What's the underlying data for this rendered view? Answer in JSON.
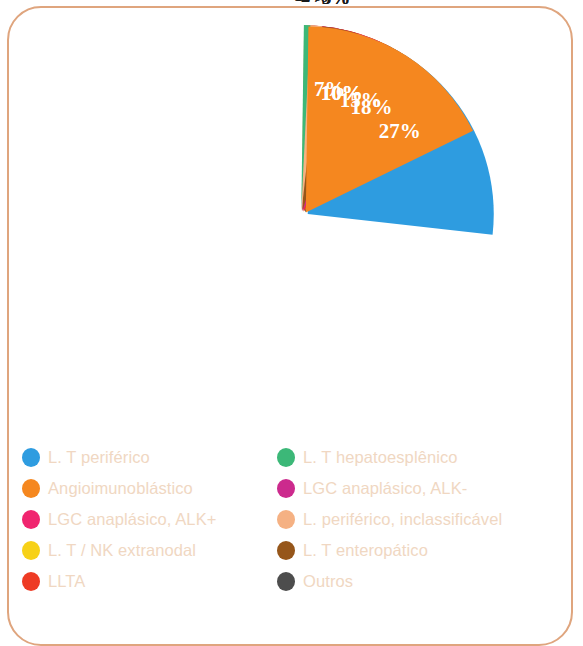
{
  "figure": {
    "frame_color": "#dfa57e",
    "background": "#ffffff",
    "legend_text_color": "#f0d7c2"
  },
  "chart_data": {
    "type": "pie",
    "title": "",
    "subtitle": "",
    "xlabel": "",
    "ylabel": "",
    "units": "percent",
    "total": 100,
    "exploded": true,
    "legend_position": "bottom",
    "grid": false,
    "start_angle_deg": -90,
    "direction": "clockwise",
    "categories": [
      "Outros",
      "L. T / NK extranodal",
      "LLTA",
      "LGC anaplásico, ALK-",
      "LGC anaplásico, ALK+",
      "L. T enteropático",
      "L. periférico, inclassificável",
      "L. T hepatoesplênico",
      "L. T periférico",
      "Angioimunoblástico"
    ],
    "values": [
      15,
      10,
      10,
      7,
      5,
      5,
      2,
      1,
      27,
      18
    ],
    "labels": [
      "15%",
      "10%",
      "10%",
      "7%",
      "5%",
      "5%",
      "2%",
      "1%",
      "27%",
      "18%"
    ],
    "colors": [
      "#4d4d4d",
      "#f7d117",
      "#ee3b24",
      "#cc2a8d",
      "#f0256f",
      "#96561a",
      "#f5b183",
      "#3cb878",
      "#2e9ce0",
      "#f5871f"
    ],
    "slices": [
      {
        "name": "Outros",
        "value": 15,
        "label": "15%",
        "color": "#4d4d4d",
        "label_placement": "inside"
      },
      {
        "name": "L. T / NK extranodal",
        "value": 10,
        "label": "10%",
        "color": "#f7d117",
        "label_placement": "inside"
      },
      {
        "name": "LLTA",
        "value": 10,
        "label": "10%",
        "color": "#ee3b24",
        "label_placement": "inside"
      },
      {
        "name": "LGC anaplásico, ALK-",
        "value": 7,
        "label": "7%",
        "color": "#cc2a8d",
        "label_placement": "inside"
      },
      {
        "name": "LGC anaplásico, ALK+",
        "value": 5,
        "label": "5%",
        "color": "#f0256f",
        "label_placement": "outside"
      },
      {
        "name": "L. T enteropático",
        "value": 5,
        "label": "5%",
        "color": "#96561a",
        "label_placement": "outside"
      },
      {
        "name": "L. periférico, inclassificável",
        "value": 2,
        "label": "2%",
        "color": "#f5b183",
        "label_placement": "outside"
      },
      {
        "name": "L. T hepatoesplênico",
        "value": 1,
        "label": "1%",
        "color": "#3cb878",
        "label_placement": "outside"
      },
      {
        "name": "L. T periférico",
        "value": 27,
        "label": "27%",
        "color": "#2e9ce0",
        "label_placement": "inside"
      },
      {
        "name": "Angioimunoblástico",
        "value": 18,
        "label": "18%",
        "color": "#f5871f",
        "label_placement": "inside"
      }
    ]
  },
  "legend": {
    "column_left": [
      {
        "label": "L. T periférico",
        "color": "#2e9ce0"
      },
      {
        "label": "Angioimunoblástico",
        "color": "#f5871f"
      },
      {
        "label": "LGC anaplásico, ALK+",
        "color": "#f0256f"
      },
      {
        "label": "L. T / NK extranodal",
        "color": "#f7d117"
      },
      {
        "label": "LLTA",
        "color": "#ee3b24"
      }
    ],
    "column_right": [
      {
        "label": "L. T hepatoesplênico",
        "color": "#3cb878"
      },
      {
        "label": "LGC anaplásico, ALK-",
        "color": "#cc2a8d"
      },
      {
        "label": "L. periférico, inclassificável",
        "color": "#f5b183"
      },
      {
        "label": "L. T enteropático",
        "color": "#96561a"
      },
      {
        "label": "Outros",
        "color": "#4d4d4d"
      }
    ]
  }
}
